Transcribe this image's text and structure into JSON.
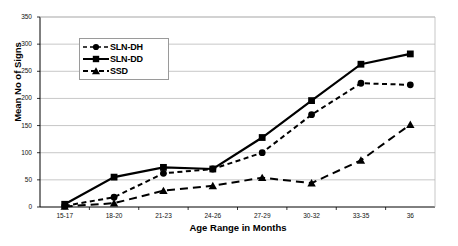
{
  "chart_data": {
    "type": "line",
    "title": "",
    "xlabel": "Age Range in Months",
    "ylabel": "Mean No of Signs",
    "categories": [
      "15-17",
      "18-20",
      "21-23",
      "24-26",
      "27-29",
      "30-32",
      "33-35",
      "36"
    ],
    "ylim": [
      0,
      350
    ],
    "yticks": [
      0,
      50,
      100,
      150,
      200,
      250,
      300,
      350
    ],
    "grid": true,
    "legend_position": "top-left-inside",
    "series": [
      {
        "name": "SLN-DH",
        "marker": "circle",
        "line_style": "dashed",
        "color": "#000000",
        "values": [
          2,
          18,
          62,
          70,
          100,
          170,
          228,
          225
        ]
      },
      {
        "name": "SLN-DD",
        "marker": "square",
        "line_style": "solid",
        "color": "#000000",
        "values": [
          5,
          55,
          73,
          70,
          128,
          196,
          263,
          282
        ]
      },
      {
        "name": "SSD",
        "marker": "triangle",
        "line_style": "dashed",
        "color": "#000000",
        "values": [
          1,
          7,
          30,
          39,
          54,
          44,
          86,
          152
        ]
      }
    ]
  },
  "axis": {
    "ytick_labels": [
      "0",
      "50",
      "100",
      "150",
      "200",
      "250",
      "300",
      "350"
    ],
    "xtick_labels": [
      "15-17",
      "18-20",
      "21-23",
      "24-26",
      "27-29",
      "30-32",
      "33-35",
      "36"
    ]
  },
  "legend": {
    "items": [
      {
        "label": "SLN-DH",
        "marker": "circle-marker",
        "style": "dashed"
      },
      {
        "label": "SLN-DD",
        "marker": "square-marker",
        "style": "solid"
      },
      {
        "label": "SSD",
        "marker": "triangle-marker",
        "style": "dashed"
      }
    ]
  }
}
